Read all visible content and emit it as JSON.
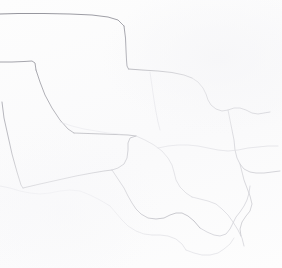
{
  "map": {
    "title": "Southwest United States Boundary Outline",
    "kind": "line-map",
    "background_color": "#fdfdfd",
    "canvas": {
      "width": 282,
      "height": 268
    },
    "styles": {
      "primary_stroke_color": "#7e7e86",
      "secondary_stroke_color": "#a8a8b0",
      "faint_stroke_color": "#c6c6ce",
      "very_faint_stroke_color": "#dcdce2",
      "primary_stroke_width": 0.9,
      "secondary_stroke_width": 0.8,
      "faint_stroke_width": 0.7
    },
    "features": [
      {
        "name": "new-mexico-north-border",
        "type": "state-boundary",
        "stroke": "#8a8a92",
        "width": 0.95,
        "path": "M 0 14 L 18 13.5 L 44 13.5 L 70 14 L 92 15 L 108 17 L 118 20 L 124 26"
      },
      {
        "name": "oklahoma-panhandle-west-border",
        "type": "state-boundary",
        "stroke": "#80808a",
        "width": 0.95,
        "path": "M 124 26 L 125.5 38 L 126 50 L 126.5 60 L 127 66 L 128.5 69"
      },
      {
        "name": "texas-panhandle-north-border",
        "type": "state-boundary",
        "stroke": "#83838c",
        "width": 0.9,
        "path": "M 128.5 69 L 142 70 L 158 71 L 172 72.5 L 184 75 L 192 78"
      },
      {
        "name": "new-mexico-texas-step-upper",
        "type": "state-boundary",
        "stroke": "#86868f",
        "width": 0.9,
        "path": "M 0 62 L 12 62 L 24 61.5 L 32 61 L 35 63 L 36 70"
      },
      {
        "name": "new-mexico-texas-diagonal",
        "type": "state-boundary",
        "stroke": "#84848d",
        "width": 0.9,
        "path": "M 36 70 L 40 82 L 45 95 L 52 108 L 60 120 L 68 129 L 74 133"
      },
      {
        "name": "texas-west-lower-horizontal",
        "type": "state-boundary",
        "stroke": "#8c8c95",
        "width": 0.85,
        "path": "M 74 133 L 88 133.5 L 102 134 L 116 134.5 L 128 135 L 136 136"
      },
      {
        "name": "new-mexico-west-border",
        "type": "state-boundary",
        "stroke": "#8d8d96",
        "width": 0.9,
        "path": "M 2 102 L 4 118 L 8 136 L 12 154 L 17 172 L 21 185 L 23 188"
      },
      {
        "name": "new-mexico-south-border",
        "type": "state-boundary",
        "stroke": "#8b8b94",
        "width": 0.9,
        "path": "M 23 188 L 40 184 L 58 180 L 76 176 L 92 173 L 104 171 L 112 170"
      },
      {
        "name": "rio-grande-upper-texas-border",
        "type": "river-boundary",
        "stroke": "#9a9aa3",
        "width": 0.85,
        "path": "M 112 170 L 118 168 L 124 164 L 127 158 L 128 150 L 128 143 L 130 138 L 136 136"
      },
      {
        "name": "rio-grande-big-bend",
        "type": "river-boundary",
        "stroke": "#a2a2ab",
        "width": 0.8,
        "path": "M 112 170 L 116 176 L 120 182 L 124 188 L 128 196 L 132 203 L 136 209 L 141 214 L 148 218 L 156 219 L 164 218 L 170 215 L 176 213 L 182 213 L 188 216 L 194 221 L 200 228"
      },
      {
        "name": "red-river-texas-oklahoma-border",
        "type": "river-boundary",
        "stroke": "#9d9da6",
        "width": 0.8,
        "path": "M 192 78 L 198 82 L 203 88 L 206 94 L 208 100 L 211 105 L 216 109 L 222 111 L 228 110 L 234 108 L 240 108 L 246 110 L 252 113 L 258 114 L 264 113 L 270 112"
      },
      {
        "name": "arkansas-louisiana-west-border",
        "type": "state-boundary",
        "stroke": "#b0b0b8",
        "width": 0.75,
        "path": "M 228 110 L 230 120 L 232 130 L 234 140 L 235 150 L 237 158 L 240 164 L 244 169 L 250 172 L 256 173 L 264 173 L 272 172 L 280 171"
      },
      {
        "name": "sabine-river-louisiana-border",
        "type": "river-boundary",
        "stroke": "#b6b6be",
        "width": 0.72,
        "path": "M 240 164 L 242 172 L 244 180 L 247 188 L 250 196 L 252 204 L 250 211 L 246 216 L 242 222 L 240 229 L 241 236"
      },
      {
        "name": "gulf-coast-texas",
        "type": "coastline",
        "stroke": "#c0c0c8",
        "width": 0.72,
        "path": "M 200 228 L 207 232 L 214 235 L 220 236 L 226 234 L 230 229 L 233 223 L 236 217 L 240 212 L 244 206 L 247 200 L 249 193 L 250 186"
      },
      {
        "name": "mexico-interior-boundary-a",
        "type": "country-boundary",
        "stroke": "#c4c4cc",
        "width": 0.7,
        "path": "M 136 136 L 145 140 L 154 145 L 162 151 L 168 158 L 172 165 L 174 172 L 176 180 L 180 187 L 186 193 L 192 197"
      },
      {
        "name": "mexico-interior-boundary-b",
        "type": "country-boundary",
        "stroke": "#c8c8d0",
        "width": 0.7,
        "path": "M 192 197 L 200 199 L 208 201 L 216 204 L 222 209 L 228 215 L 233 222 L 238 230 L 242 238 L 244 246"
      },
      {
        "name": "mexico-state-line-north",
        "type": "country-boundary",
        "stroke": "#cacad2",
        "width": 0.68,
        "path": "M 158 148 L 168 146 L 178 145 L 188 145 L 198 146 L 208 148 L 218 150 L 228 151 L 238 150 L 248 148 L 258 147 L 268 146 L 278 146"
      },
      {
        "name": "mexico-state-line-south",
        "type": "country-boundary",
        "stroke": "#d0d0d8",
        "width": 0.68,
        "path": "M 0 186 L 10 188 L 20 191 L 30 193 L 40 194 L 50 193 L 60 191 L 70 190 L 80 191 L 90 195 L 100 200 L 110 206"
      },
      {
        "name": "mexico-south-detail",
        "type": "country-boundary",
        "stroke": "#d6d6dc",
        "width": 0.65,
        "path": "M 110 206 L 116 213 L 122 220 L 128 226 L 136 231 L 144 234 L 152 235 L 160 235 L 168 236 L 176 239 L 182 244 L 186 250"
      },
      {
        "name": "gulf-shoreline-faint",
        "type": "coastline",
        "stroke": "#d8d8de",
        "width": 0.65,
        "path": "M 186 250 L 194 253 L 202 255 L 210 255 L 218 253 L 224 249 L 230 244 L 234 238"
      },
      {
        "name": "panhandle-east-faint",
        "type": "state-boundary",
        "stroke": "#d2d2da",
        "width": 0.65,
        "path": "M 150 72 L 152 86 L 154 100 L 156 112 L 158 122 L 160 130"
      },
      {
        "name": "texas-interior-faint",
        "type": "reference-line",
        "stroke": "#dedee4",
        "width": 0.6,
        "path": "M 60 122 L 72 126 L 84 129 L 96 131 L 108 133 L 120 134"
      }
    ]
  }
}
